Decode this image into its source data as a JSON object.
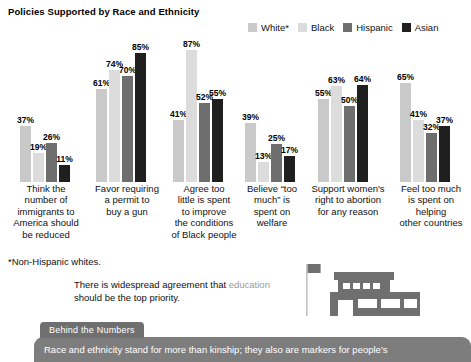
{
  "chart_title": "Policies Supported by Race and Ethnicity",
  "footnote": "*Non-Hispanic whites.",
  "pullquote": {
    "before": "There is widespread agreement that",
    "highlight": "education",
    "after": "should be the top priority."
  },
  "behind": {
    "tab_label": "Behind the Numbers",
    "body": "Race and ethnicity stand for more than kinship; they also are markers for people's"
  },
  "icons": {
    "school": "school-building-icon",
    "flag": "flag-icon"
  },
  "chart_data": {
    "type": "bar",
    "title": "Policies Supported by Race and Ethnicity",
    "xlabel": "",
    "ylabel": "",
    "ylim": [
      0,
      100
    ],
    "grid": false,
    "legend_position": "top-right",
    "value_suffix": "%",
    "categories": [
      "Think the number of immigrants to America should be reduced",
      "Favor requiring a permit to buy a gun",
      "Agree too little is spent to improve the conditions of Black people",
      "Believe “too much” is spent on welfare",
      "Support women's right to abortion for any reason",
      "Feel too much is spent on helping other countries"
    ],
    "category_lines": [
      [
        "Think the",
        "number of",
        "immigrants to",
        "America should",
        "be reduced"
      ],
      [
        "Favor requiring",
        "a permit to",
        "buy a gun"
      ],
      [
        "Agree too",
        "little is spent",
        "to improve",
        "the conditions",
        "of Black people"
      ],
      [
        "Believe “too",
        "much” is",
        "spent on",
        "welfare"
      ],
      [
        "Support women's",
        "right to abortion",
        "for any reason"
      ],
      [
        "Feel too much",
        "is spent on",
        "helping",
        "other countries"
      ]
    ],
    "series": [
      {
        "name": "White*",
        "color": "#c9c9c9",
        "values": [
          37,
          61,
          41,
          39,
          55,
          65
        ]
      },
      {
        "name": "Black",
        "color": "#dcdcdc",
        "values": [
          19,
          74,
          87,
          13,
          63,
          41
        ]
      },
      {
        "name": "Hispanic",
        "color": "#6e6e6e",
        "values": [
          26,
          70,
          52,
          25,
          50,
          32
        ]
      },
      {
        "name": "Asian",
        "color": "#1f1f1f",
        "values": [
          11,
          85,
          55,
          17,
          64,
          37
        ]
      }
    ],
    "labels": [
      [
        "37%",
        "19%",
        "26%",
        "11%"
      ],
      [
        "61%",
        "74%",
        "70%",
        "85%"
      ],
      [
        "41%",
        "87%",
        "52%",
        "55%"
      ],
      [
        "39%",
        "13%",
        "25%",
        "17%"
      ],
      [
        "55%",
        "63%",
        "50%",
        "64%"
      ],
      [
        "65%",
        "41%",
        "32%",
        "37%"
      ]
    ]
  }
}
